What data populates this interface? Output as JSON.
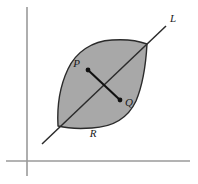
{
  "figure": {
    "type": "geometry-diagram",
    "background_color": "#ffffff",
    "region": {
      "name": "R",
      "label": "R",
      "fill_color": "#a8a8a8",
      "stroke_color": "#2b2b2b",
      "label_position": {
        "x": 93,
        "y": 137
      }
    },
    "line": {
      "name": "L",
      "label": "L",
      "stroke_color": "#2b2b2b",
      "start": {
        "x": 42,
        "y": 144
      },
      "end": {
        "x": 166,
        "y": 26
      },
      "label_position": {
        "x": 170,
        "y": 22
      }
    },
    "points": [
      {
        "name": "P",
        "label": "P",
        "x": 88,
        "y": 70,
        "label_position": {
          "x": 80,
          "y": 67
        },
        "dot_color": "#111111"
      },
      {
        "name": "Q",
        "label": "Q",
        "x": 120,
        "y": 100,
        "label_position": {
          "x": 125,
          "y": 106
        },
        "dot_color": "#111111"
      }
    ],
    "segment_pq": {
      "name": "segment-PQ",
      "stroke_color": "#111111",
      "from": "P",
      "to": "Q"
    },
    "axes": {
      "stroke_color": "#9a9a9a",
      "vertical": {
        "x": 27,
        "y_top": 7,
        "y_bottom": 176
      },
      "horizontal": {
        "y": 161,
        "x_left": 6,
        "x_right": 190
      }
    }
  }
}
